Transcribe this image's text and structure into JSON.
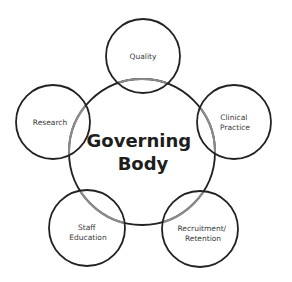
{
  "diagram": {
    "background": "#ffffff",
    "stroke_color": "#222222",
    "overlap_stroke_color": "#8a8a8a",
    "center": {
      "label_lines": [
        "Governing",
        "Body"
      ],
      "cx": 142,
      "cy": 152,
      "r": 73
    },
    "satellites": [
      {
        "id": "quality",
        "label_lines": [
          "Quality"
        ],
        "cx": 143,
        "cy": 56,
        "r": 37
      },
      {
        "id": "clinical",
        "label_lines": [
          "Clinical",
          "Practice"
        ],
        "cx": 234,
        "cy": 122,
        "r": 37
      },
      {
        "id": "recruitment",
        "label_lines": [
          "Recruitment/",
          "Retention"
        ],
        "cx": 200,
        "cy": 229,
        "r": 38
      },
      {
        "id": "staff",
        "label_lines": [
          "Staff",
          "Education"
        ],
        "cx": 87,
        "cy": 228,
        "r": 38
      },
      {
        "id": "research",
        "label_lines": [
          "Research"
        ],
        "cx": 53,
        "cy": 122,
        "r": 37
      }
    ]
  }
}
